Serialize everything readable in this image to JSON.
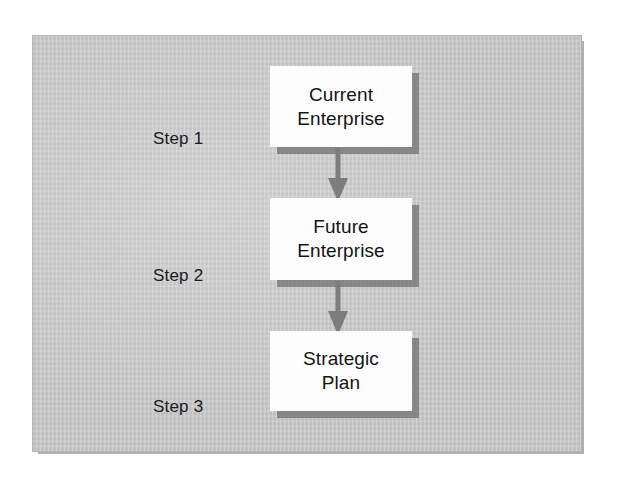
{
  "figure": {
    "type": "flowchart",
    "orientation": "vertical",
    "colors": {
      "panel_background": "#c6c6c6",
      "panel_edge": "#b0b0b0",
      "node_fill": "#fdfdfd",
      "node_shadow": "#6e6e6e",
      "arrow": "#7d7d7d",
      "text": "#141414",
      "canvas_background": "#ffffff"
    }
  },
  "steps": [
    {
      "label": "Step 1",
      "node_lines": [
        "Current",
        "Enterprise"
      ],
      "node_text": "Current Enterprise"
    },
    {
      "label": "Step 2",
      "node_lines": [
        "Future",
        "Enterprise"
      ],
      "node_text": "Future Enterprise"
    },
    {
      "label": "Step 3",
      "node_lines": [
        "Strategic",
        "Plan"
      ],
      "node_text": "Strategic Plan"
    }
  ],
  "connectors": [
    {
      "name": "arrow-step1-to-step2",
      "from": "Current Enterprise",
      "to": "Future Enterprise",
      "direction": "down"
    },
    {
      "name": "arrow-step2-to-step3",
      "from": "Future Enterprise",
      "to": "Strategic Plan",
      "direction": "down"
    }
  ]
}
